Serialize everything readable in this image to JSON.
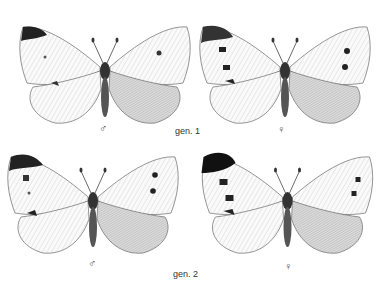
{
  "plate": {
    "rows": [
      {
        "generation_label": "gen. 1",
        "specimens": [
          {
            "sex_symbol": "♂",
            "sex": "male"
          },
          {
            "sex_symbol": "♀",
            "sex": "female"
          }
        ]
      },
      {
        "generation_label": "gen. 2",
        "specimens": [
          {
            "sex_symbol": "♂",
            "sex": "male"
          },
          {
            "sex_symbol": "♀",
            "sex": "female"
          }
        ]
      }
    ]
  }
}
